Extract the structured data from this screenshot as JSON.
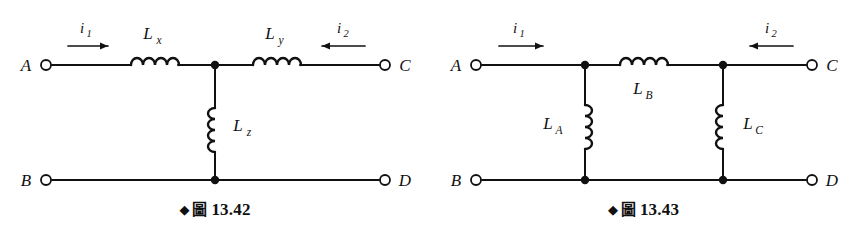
{
  "page": {
    "background_color": "#ffffff",
    "ink_color": "#111111",
    "width": 857,
    "height": 240
  },
  "figures": [
    {
      "id": "fig-13-42",
      "caption": {
        "diamond": "◆",
        "cjk": "圖",
        "number": "13.42"
      },
      "terminals": [
        {
          "name": "terminal-a",
          "label": "A",
          "side": "left",
          "rail": "top"
        },
        {
          "name": "terminal-c",
          "label": "C",
          "side": "right",
          "rail": "top"
        },
        {
          "name": "terminal-b",
          "label": "B",
          "side": "left",
          "rail": "bottom"
        },
        {
          "name": "terminal-d",
          "label": "D",
          "side": "right",
          "rail": "bottom"
        }
      ],
      "currents": [
        {
          "name": "current-i1",
          "symbol": "i",
          "subscript": "1",
          "direction": "right"
        },
        {
          "name": "current-i2",
          "symbol": "i",
          "subscript": "2",
          "direction": "left"
        }
      ],
      "inductors": [
        {
          "name": "inductor-lx",
          "symbol": "L",
          "subscript": "x",
          "orientation": "horizontal",
          "label_position": "above"
        },
        {
          "name": "inductor-ly",
          "symbol": "L",
          "subscript": "y",
          "orientation": "horizontal",
          "label_position": "above"
        },
        {
          "name": "inductor-lz",
          "symbol": "L",
          "subscript": "z",
          "orientation": "vertical",
          "label_position": "right"
        }
      ],
      "junction_count": 2,
      "topology": "tee-network"
    },
    {
      "id": "fig-13-43",
      "caption": {
        "diamond": "◆",
        "cjk": "圖",
        "number": "13.43"
      },
      "terminals": [
        {
          "name": "terminal-a",
          "label": "A",
          "side": "left",
          "rail": "top"
        },
        {
          "name": "terminal-c",
          "label": "C",
          "side": "right",
          "rail": "top"
        },
        {
          "name": "terminal-b",
          "label": "B",
          "side": "left",
          "rail": "bottom"
        },
        {
          "name": "terminal-d",
          "label": "D",
          "side": "right",
          "rail": "bottom"
        }
      ],
      "currents": [
        {
          "name": "current-i1",
          "symbol": "i",
          "subscript": "1",
          "direction": "right"
        },
        {
          "name": "current-i2",
          "symbol": "i",
          "subscript": "2",
          "direction": "left"
        }
      ],
      "inductors": [
        {
          "name": "inductor-la",
          "symbol": "L",
          "subscript": "A",
          "orientation": "vertical",
          "label_position": "left"
        },
        {
          "name": "inductor-lb",
          "symbol": "L",
          "subscript": "B",
          "orientation": "horizontal",
          "label_position": "below"
        },
        {
          "name": "inductor-lc",
          "symbol": "L",
          "subscript": "C",
          "orientation": "vertical",
          "label_position": "right"
        }
      ],
      "junction_count": 4,
      "topology": "pi-network"
    }
  ]
}
